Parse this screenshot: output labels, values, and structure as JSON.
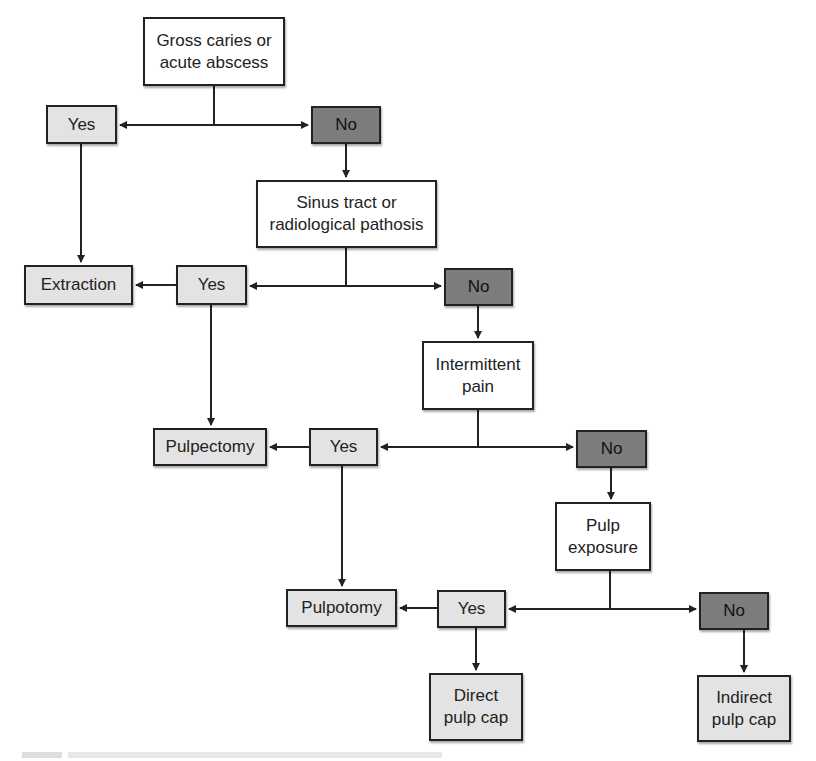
{
  "diagram": {
    "type": "decision-flowchart",
    "nodes": {
      "q1": {
        "label": "Gross caries or\nacute abscess",
        "kind": "question"
      },
      "q1_yes": {
        "label": "Yes",
        "kind": "yes"
      },
      "q1_no": {
        "label": "No",
        "kind": "no"
      },
      "q2": {
        "label": "Sinus tract or\nradiological pathosis",
        "kind": "question"
      },
      "extraction": {
        "label": "Extraction",
        "kind": "treatment"
      },
      "q2_yes": {
        "label": "Yes",
        "kind": "yes"
      },
      "q2_no": {
        "label": "No",
        "kind": "no"
      },
      "q3": {
        "label": "Intermittent\npain",
        "kind": "question"
      },
      "pulpectomy": {
        "label": "Pulpectomy",
        "kind": "treatment"
      },
      "q3_yes": {
        "label": "Yes",
        "kind": "yes"
      },
      "q3_no": {
        "label": "No",
        "kind": "no"
      },
      "q4": {
        "label": "Pulp\nexposure",
        "kind": "question"
      },
      "pulpotomy": {
        "label": "Pulpotomy",
        "kind": "treatment"
      },
      "q4_yes": {
        "label": "Yes",
        "kind": "yes"
      },
      "q4_no": {
        "label": "No",
        "kind": "no"
      },
      "direct_cap": {
        "label": "Direct\npulp cap",
        "kind": "treatment"
      },
      "indirect_cap": {
        "label": "Indirect\npulp cap",
        "kind": "treatment"
      }
    },
    "edges": [
      [
        "q1",
        "q1_yes"
      ],
      [
        "q1",
        "q1_no"
      ],
      [
        "q1_yes",
        "extraction"
      ],
      [
        "q1_no",
        "q2"
      ],
      [
        "q2",
        "q2_yes"
      ],
      [
        "q2",
        "q2_no"
      ],
      [
        "q2_yes",
        "extraction"
      ],
      [
        "q2_yes",
        "pulpectomy"
      ],
      [
        "q2_no",
        "q3"
      ],
      [
        "q3",
        "q3_yes"
      ],
      [
        "q3",
        "q3_no"
      ],
      [
        "q3_yes",
        "pulpectomy"
      ],
      [
        "q3_yes",
        "pulpotomy"
      ],
      [
        "q3_no",
        "q4"
      ],
      [
        "q4",
        "q4_yes"
      ],
      [
        "q4",
        "q4_no"
      ],
      [
        "q4_yes",
        "pulpotomy"
      ],
      [
        "q4_yes",
        "direct_cap"
      ],
      [
        "q4_no",
        "indirect_cap"
      ]
    ],
    "colors": {
      "question": "#ffffff",
      "yes": "#e3e3e3",
      "treatment": "#e3e3e3",
      "no": "#7d7d7d",
      "line": "#222222"
    }
  }
}
